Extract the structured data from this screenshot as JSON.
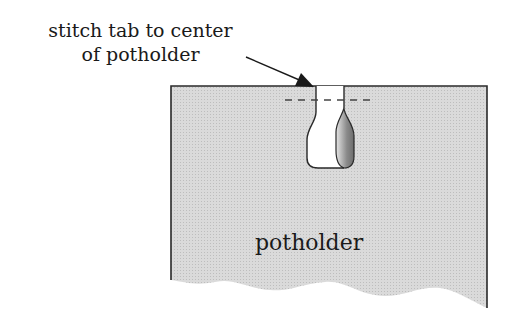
{
  "callout": {
    "line1": "stitch tab to center",
    "line2": "of potholder"
  },
  "potholder_label": "potholder",
  "colors": {
    "fill": "#d6d6d6",
    "stroke": "#2a2a2a",
    "tab_fill": "#ffffff",
    "lobe_dark": "#7a7a7a",
    "lobe_light": "#dcdcdc"
  }
}
